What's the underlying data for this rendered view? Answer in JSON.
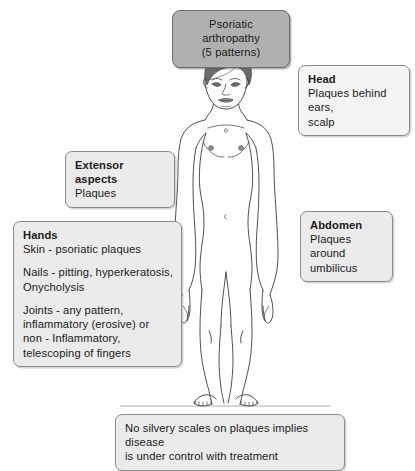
{
  "diagram": {
    "title_box": {
      "line1": "Psoriatic arthropathy",
      "line2": "(5 patterns)"
    },
    "head_box": {
      "heading": "Head",
      "line1": "Plaques behind ears,",
      "line2": "scalp"
    },
    "extensor_box": {
      "heading": "Extensor aspects",
      "line1": "Plaques"
    },
    "abdomen_box": {
      "heading": "Abdomen",
      "line1": "Plaques around",
      "line2": "umbilicus"
    },
    "hands_box": {
      "heading": "Hands",
      "skin_line": "Skin - psoriatic plaques",
      "nails_line1": "Nails - pitting, hyperkeratosis,",
      "nails_line2": "Onycholysis",
      "joints_line1": "Joints - any pattern,",
      "joints_line2": "inflammatory (erosive) or",
      "joints_line3": "non - Inflammatory,",
      "joints_line4": "telescoping of fingers"
    },
    "bottom_box": {
      "line1": "No silvery scales on plaques implies disease",
      "line2": "is under control with treatment"
    },
    "figure": {
      "name": "anterior-human-body-outline",
      "hair_color": "#6b6b6b",
      "outline_color": "#3c3c3c",
      "skin_fill": "#ffffff"
    },
    "colors": {
      "title_fill": "#b0b0b0",
      "label_fill": "#ebebeb",
      "border": "#8a8a8a",
      "text": "#1a1a1a"
    }
  }
}
